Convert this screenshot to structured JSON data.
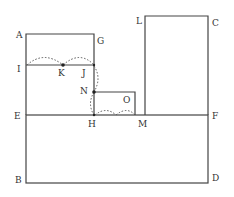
{
  "diagram": {
    "colors": {
      "line": "#444444",
      "dotted": "#555555",
      "label": "#333333",
      "background": "#ffffff"
    },
    "labels": {
      "A": "A",
      "G": "G",
      "I": "I",
      "K": "K",
      "J": "J",
      "N": "N",
      "O": "O",
      "E": "E",
      "H": "H",
      "M": "M",
      "F": "F",
      "L": "L",
      "C": "C",
      "B": "B",
      "D": "D"
    },
    "points": {
      "A": [
        26,
        34
      ],
      "G": [
        94,
        34
      ],
      "I": [
        26,
        65
      ],
      "K": [
        63,
        65
      ],
      "J": [
        94,
        65
      ],
      "N": [
        94,
        92
      ],
      "O": [
        135,
        92
      ],
      "E": [
        26,
        115
      ],
      "H": [
        94,
        115
      ],
      "M": [
        135,
        115
      ],
      "F": [
        208,
        115
      ],
      "L": [
        145,
        16
      ],
      "C": [
        208,
        16
      ],
      "B": [
        26,
        183
      ],
      "D": [
        208,
        183
      ]
    }
  }
}
